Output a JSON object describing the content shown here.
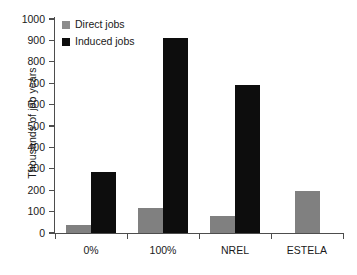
{
  "chart_data": {
    "type": "bar",
    "title": "",
    "subtitle": "",
    "xlabel": "",
    "ylabel": "Thousands of job years",
    "categories": [
      "0%",
      "100%",
      "NREL",
      "ESTELA"
    ],
    "series": [
      {
        "name": "Direct jobs",
        "color": "#808080",
        "values": [
          37,
          115,
          80,
          195
        ]
      },
      {
        "name": "Induced jobs",
        "color": "#0d0d0d",
        "values": [
          285,
          911,
          692,
          null
        ]
      }
    ],
    "ylim": [
      0,
      1000
    ],
    "yticks": [
      0,
      100,
      200,
      300,
      400,
      500,
      600,
      700,
      800,
      900,
      1000
    ],
    "ytick_labels": [
      "0",
      "100",
      "200",
      "300",
      "400",
      "500",
      "600",
      "700",
      "800",
      "900",
      "1000"
    ],
    "grid": false,
    "legend_position": "top-left",
    "legend": [
      {
        "label": "Direct jobs",
        "color": "#808080"
      },
      {
        "label": "Induced jobs",
        "color": "#0d0d0d"
      }
    ],
    "annotations": []
  },
  "colors": {
    "direct": "#808080",
    "induced": "#0d0d0d",
    "axis": "#4d4d4d",
    "text": "#1a1a1a",
    "background": "#ffffff"
  }
}
